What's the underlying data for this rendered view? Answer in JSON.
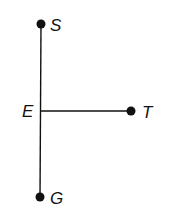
{
  "diagram": {
    "points": {
      "S": {
        "label": "S",
        "x": 41,
        "y": 24
      },
      "E": {
        "label": "E",
        "x": 41,
        "y": 111
      },
      "T": {
        "label": "T",
        "x": 131,
        "y": 111
      },
      "G": {
        "label": "G",
        "x": 40,
        "y": 197
      }
    },
    "segments": [
      {
        "from": "S",
        "to": "G"
      },
      {
        "from": "E",
        "to": "T"
      }
    ],
    "colors": {
      "ink": "#111111",
      "background": "#ffffff"
    }
  }
}
